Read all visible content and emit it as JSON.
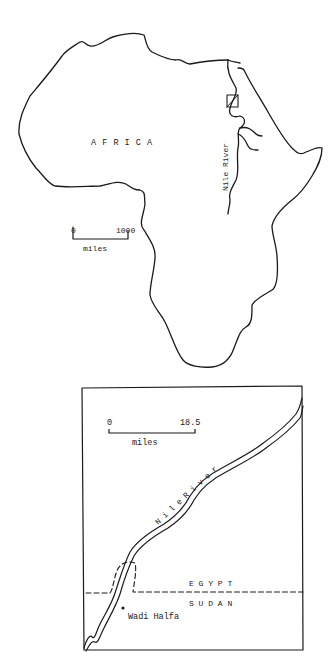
{
  "africa_map": {
    "region_label": "A F R I C A",
    "river_label": "Nile River",
    "scale": {
      "start": "0",
      "end": "1000",
      "unit": "miles"
    }
  },
  "inset_map": {
    "scale": {
      "start": "0",
      "end": "18.5",
      "unit": "miles"
    },
    "river_label": "N i l e R i v e r",
    "country_north": "E G Y P T",
    "country_south": "S U D A N",
    "town_label": "Wadi Halfa"
  },
  "colors": {
    "ink": "#1a1a1a",
    "paper": "#ffffff"
  }
}
